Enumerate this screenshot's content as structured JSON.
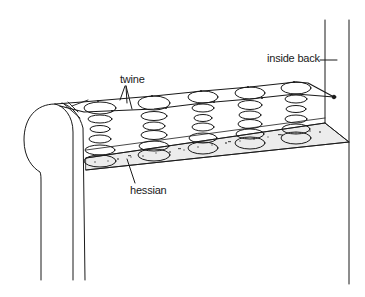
{
  "diagram": {
    "labels": {
      "inside_back": "inside back",
      "twine": "twine",
      "hessian": "hessian"
    },
    "spring_count": 5,
    "colors": {
      "line": "#1a1a1a",
      "background": "#ffffff",
      "hessian_fill": "#e6e6e6"
    }
  }
}
